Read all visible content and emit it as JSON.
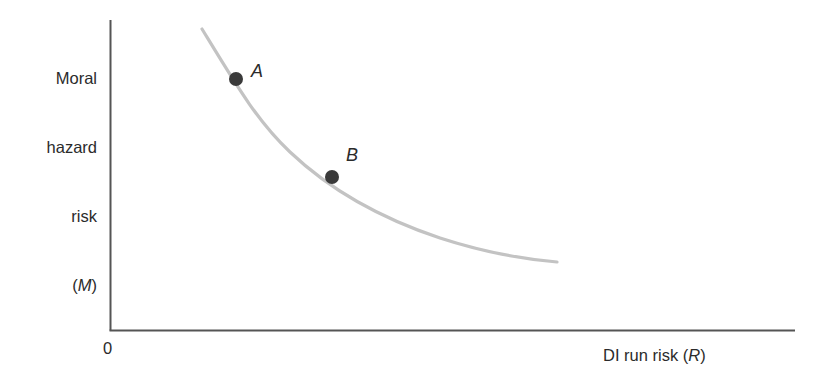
{
  "figure": {
    "background_color": "#ffffff",
    "width": 833,
    "height": 388
  },
  "axes": {
    "origin_label": "0",
    "y_axis_title_lines": [
      "Moral",
      "hazard",
      "risk"
    ],
    "y_axis_variable": "M",
    "y_axis_variable_open": "(",
    "y_axis_variable_close": ")",
    "x_axis_title_prefix": "DI run risk (",
    "x_axis_variable": "R",
    "x_axis_title_suffix": ")",
    "axis_color": "#555555"
  },
  "curve": {
    "color": "#c3c3c3",
    "width": 3.2,
    "path": "M 202 29 C 238 88 258 122 290 152 C 330 190 380 218 440 238 C 483 252 522 259 557 262"
  },
  "points": [
    {
      "label": "A",
      "color": "#3a3a3a",
      "cx": 236,
      "cy": 79,
      "r": 7
    },
    {
      "label": "B",
      "color": "#3a3a3a",
      "cx": 332,
      "cy": 177,
      "r": 7
    }
  ],
  "chart_data": {
    "type": "line",
    "title": "",
    "subtitle": "",
    "xlabel": "DI run risk (R)",
    "ylabel": "Moral hazard risk (M)",
    "xlim": [
      0,
      1
    ],
    "ylim": [
      0,
      1
    ],
    "grid": false,
    "legend": "none",
    "axis_tick_labels": {
      "x": [],
      "y": [],
      "origin": "0"
    },
    "series": [
      {
        "name": "Moral hazard / DI run risk trade-off frontier",
        "shape": "convex decreasing",
        "x": [
          0.133,
          0.183,
          0.262,
          0.324,
          0.4,
          0.477,
          0.553,
          0.63,
          0.707,
          0.783
        ],
        "y": [
          0.971,
          0.81,
          0.681,
          0.603,
          0.534,
          0.471,
          0.423,
          0.383,
          0.353,
          0.335
        ]
      }
    ],
    "annotations": [
      {
        "text": "A",
        "x": 0.183,
        "y": 0.81,
        "marker": "filled-circle"
      },
      {
        "text": "B",
        "x": 0.324,
        "y": 0.603,
        "marker": "filled-circle"
      }
    ]
  }
}
